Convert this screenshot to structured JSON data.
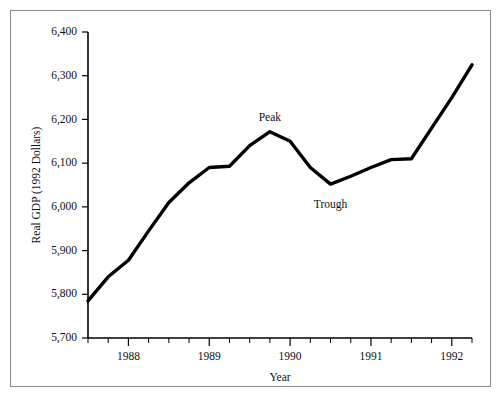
{
  "chart_data": {
    "type": "line",
    "title": "",
    "subtitle": "",
    "xlabel": "Year",
    "ylabel": "Real GDP (1992 Dollars)",
    "xlim": [
      1987.5,
      1992.25
    ],
    "ylim": [
      5700,
      6400
    ],
    "grid": false,
    "legend": null,
    "ytick_labels": [
      "6,400",
      "6,300",
      "6,200",
      "6,100",
      "6,000",
      "5,900",
      "5,800",
      "5,700"
    ],
    "ytick_values": [
      6400,
      6300,
      6200,
      6100,
      6000,
      5900,
      5800,
      5700
    ],
    "xtick_labels": [
      "1988",
      "1989",
      "1990",
      "1991",
      "1992"
    ],
    "xtick_values": [
      1988,
      1989,
      1990,
      1991,
      1992
    ],
    "x_minor_interval": 0.25,
    "series": [
      {
        "name": "Real GDP",
        "x": [
          1987.5,
          1987.75,
          1988.0,
          1988.25,
          1988.5,
          1988.75,
          1989.0,
          1989.25,
          1989.5,
          1989.75,
          1990.0,
          1990.25,
          1990.5,
          1990.75,
          1991.0,
          1991.25,
          1991.5,
          1991.75,
          1992.0,
          1992.25
        ],
        "values": [
          5785,
          5840,
          5878,
          5945,
          6010,
          6055,
          6090,
          6093,
          6140,
          6172,
          6150,
          6090,
          6052,
          6070,
          6090,
          6108,
          6110,
          6180,
          6250,
          6325
        ]
      }
    ],
    "annotations": [
      {
        "label": "Peak",
        "x": 1989.75,
        "y": 6172,
        "position": "above"
      },
      {
        "label": "Trough",
        "x": 1990.5,
        "y": 6052,
        "position": "below"
      }
    ]
  }
}
